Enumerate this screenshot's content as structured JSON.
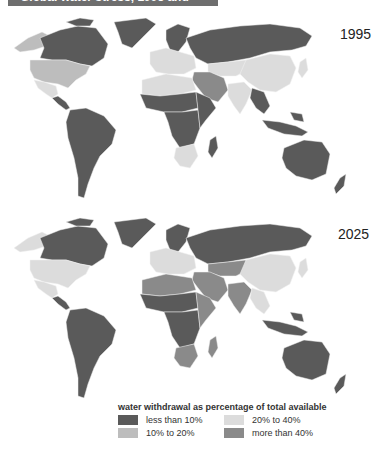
{
  "title": "Global water stress, 1995 and 2025",
  "colors": {
    "less_than_10": "#5a5a5a",
    "10_to_20": "#bdbdbd",
    "20_to_40": "#dcdcdc",
    "more_than_40": "#8a8a8a"
  },
  "maps": [
    {
      "year": "1995",
      "regions": {
        "alaska": "10_to_20",
        "canada": "less_than_10",
        "greenland": "less_than_10",
        "usa": "10_to_20",
        "mexico": "20_to_40",
        "central_america": "less_than_10",
        "south_america": "less_than_10",
        "north_africa": "20_to_40",
        "sahel": "less_than_10",
        "central_africa": "less_than_10",
        "east_africa": "less_than_10",
        "southern_africa": "20_to_40",
        "madagascar": "less_than_10",
        "europe_west": "20_to_40",
        "scandinavia": "less_than_10",
        "russia": "less_than_10",
        "middle_east": "more_than_40",
        "central_asia": "20_to_40",
        "china": "20_to_40",
        "india": "20_to_40",
        "southeast_asia": "less_than_10",
        "indonesia": "less_than_10",
        "japan": "20_to_40",
        "australia": "less_than_10",
        "new_zealand": "less_than_10"
      }
    },
    {
      "year": "2025",
      "regions": {
        "alaska": "20_to_40",
        "canada": "less_than_10",
        "greenland": "less_than_10",
        "usa": "20_to_40",
        "mexico": "20_to_40",
        "central_america": "less_than_10",
        "south_america": "less_than_10",
        "north_africa": "more_than_40",
        "sahel": "less_than_10",
        "central_africa": "less_than_10",
        "east_africa": "more_than_40",
        "southern_africa": "more_than_40",
        "madagascar": "more_than_40",
        "europe_west": "20_to_40",
        "scandinavia": "less_than_10",
        "russia": "less_than_10",
        "middle_east": "more_than_40",
        "central_asia": "more_than_40",
        "china": "20_to_40",
        "india": "more_than_40",
        "southeast_asia": "20_to_40",
        "indonesia": "less_than_10",
        "japan": "20_to_40",
        "australia": "less_than_10",
        "new_zealand": "less_than_10"
      }
    }
  ],
  "legend": {
    "title": "water withdrawal as percentage of total available",
    "items": [
      {
        "key": "less_than_10",
        "label": "less than 10%"
      },
      {
        "key": "20_to_40",
        "label": "20% to 40%"
      },
      {
        "key": "10_to_20",
        "label": "10% to 20%"
      },
      {
        "key": "more_than_40",
        "label": "more than 40%"
      }
    ]
  }
}
